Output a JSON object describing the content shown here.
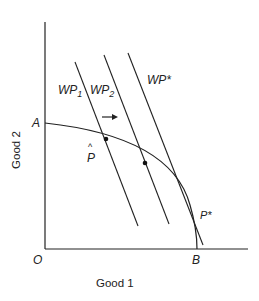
{
  "axes": {
    "x_label": "Good 1",
    "y_label": "Good 2",
    "origin_label": "O"
  },
  "points": {
    "A": "A",
    "B": "B",
    "p_hat": "P",
    "p_hat_accent": "^",
    "p_star": "P*"
  },
  "lines": [
    {
      "name": "WP",
      "sub": "1"
    },
    {
      "name": "WP",
      "sub": "2"
    },
    {
      "name": "WP*",
      "sub": ""
    }
  ],
  "arrow": "shift right",
  "colors": {
    "ink": "#222222",
    "background": "#ffffff"
  }
}
